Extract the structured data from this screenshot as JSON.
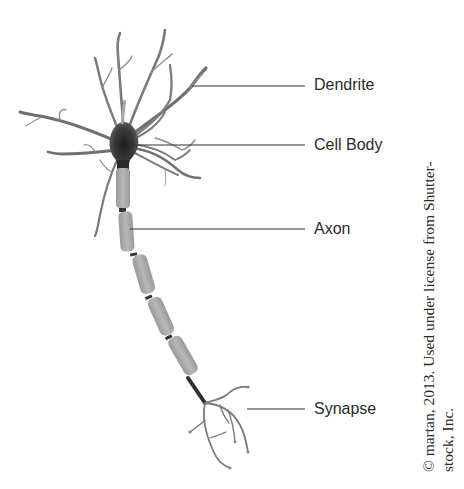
{
  "diagram": {
    "labels": [
      {
        "id": "dendrite",
        "text": "Dendrite",
        "y": 85
      },
      {
        "id": "cell-body",
        "text": "Cell Body",
        "y": 145
      },
      {
        "id": "axon",
        "text": "Axon",
        "y": 230
      },
      {
        "id": "synapse",
        "text": "Synapse",
        "y": 410
      }
    ],
    "credit": {
      "line1": "© martan, 2013. Used under license from Shutter-",
      "line2": "stock, Inc."
    },
    "colors": {
      "background": "#ffffff",
      "neuron_dark": "#2b2b2b",
      "neuron_mid": "#6e6e6e",
      "myelin": "#a9a9a9",
      "leader_line": "#333333",
      "text": "#2a2a2a"
    }
  }
}
